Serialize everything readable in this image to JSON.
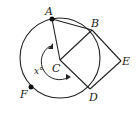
{
  "diagram": {
    "type": "geometry",
    "circle": {
      "center": "C",
      "cx": 60,
      "cy": 58,
      "r": 40
    },
    "points": {
      "A": {
        "label": "A",
        "x": 52,
        "y": 19,
        "marked": true
      },
      "B": {
        "label": "B",
        "x": 92,
        "y": 30
      },
      "C": {
        "label": "C",
        "x": 60,
        "y": 60
      },
      "D": {
        "label": "D",
        "x": 90,
        "y": 89
      },
      "E": {
        "label": "E",
        "x": 121,
        "y": 61
      },
      "F": {
        "label": "F",
        "x": 31,
        "y": 87,
        "marked": true
      }
    },
    "segments": [
      [
        "A",
        "B"
      ],
      [
        "A",
        "C"
      ],
      [
        "C",
        "B"
      ],
      [
        "C",
        "D"
      ],
      [
        "B",
        "E"
      ],
      [
        "D",
        "E"
      ]
    ],
    "angle_label": "x°",
    "colors": {
      "stroke": "#222222",
      "background": "#ffffff"
    }
  }
}
